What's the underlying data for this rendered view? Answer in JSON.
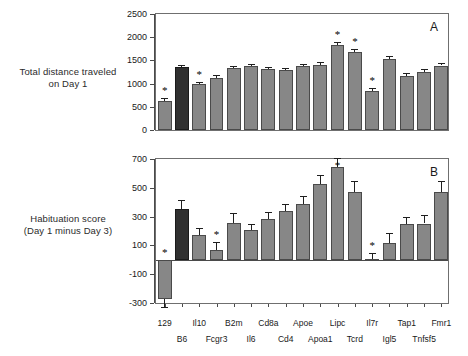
{
  "chart_data": [
    {
      "type": "bar",
      "panel": "A",
      "title": "",
      "ylabel": "Total distance traveled on Day 1",
      "ylabel_lines": [
        "Total distance traveled",
        "on Day 1"
      ],
      "xlabel": "",
      "ylim": [
        0,
        2500
      ],
      "yticks": [
        0,
        500,
        1000,
        1500,
        2000,
        2500
      ],
      "grid": false,
      "legend": "none",
      "categories": [
        "129",
        "B6",
        "Il10",
        "Fcgr3",
        "B2m",
        "Il6",
        "Cd8a",
        "Cd4",
        "Apoe",
        "Apoa1",
        "Lipc",
        "Tcrd",
        "Il7r",
        "Igl5",
        "Tap1",
        "Tnfsf5",
        "Fmr1"
      ],
      "values": [
        620,
        1355,
        995,
        1120,
        1330,
        1370,
        1310,
        1290,
        1370,
        1405,
        1835,
        1690,
        840,
        1525,
        1170,
        1260,
        1390
      ],
      "errors": [
        75,
        45,
        50,
        55,
        55,
        45,
        55,
        50,
        45,
        60,
        70,
        65,
        55,
        60,
        55,
        65,
        55
      ],
      "dark_bars": [
        "B6"
      ],
      "significant": [
        "129",
        "Il10",
        "Lipc",
        "Tcrd",
        "Il7r"
      ]
    },
    {
      "type": "bar",
      "panel": "B",
      "title": "",
      "ylabel": "Habituation score (Day 1 minus Day 3)",
      "ylabel_lines": [
        "Habituation score",
        "(Day 1 minus Day 3)"
      ],
      "xlabel": "",
      "ylim": [
        -300,
        700
      ],
      "yticks": [
        -300,
        -100,
        100,
        300,
        500,
        700
      ],
      "grid": false,
      "legend": "none",
      "categories": [
        "129",
        "B6",
        "Il10",
        "Fcgr3",
        "B2m",
        "Il6",
        "Cd8a",
        "Cd4",
        "Apoe",
        "Apoa1",
        "Lipc",
        "Tcrd",
        "Il7r",
        "Igl5",
        "Tap1",
        "Tnfsf5",
        "Fmr1"
      ],
      "values": [
        -272,
        352,
        175,
        70,
        255,
        205,
        280,
        337,
        390,
        525,
        645,
        472,
        8,
        118,
        250,
        252,
        472
      ],
      "errors": [
        55,
        60,
        48,
        55,
        70,
        45,
        55,
        50,
        55,
        62,
        62,
        78,
        42,
        70,
        48,
        60,
        72
      ],
      "dark_bars": [
        "B6"
      ],
      "significant": [
        "129",
        "Fcgr3",
        "Lipc",
        "Il7r"
      ]
    }
  ],
  "panels": {
    "a": {
      "letter": "A"
    },
    "b": {
      "letter": "B"
    }
  },
  "axis_labels": {
    "a_line1": "Total distance traveled",
    "a_line2": "on Day 1",
    "b_line1": "Habituation score",
    "b_line2": "(Day 1 minus Day 3)"
  },
  "yticks_a": [
    "2500",
    "2000",
    "1500",
    "1000",
    "500",
    "0"
  ],
  "yticks_b": [
    "700",
    "500",
    "300",
    "100",
    "-100",
    "-300"
  ],
  "xticks_row1": [
    "129",
    "Il10",
    "B2m",
    "Cd8a",
    "Apoe",
    "Lipc",
    "Il7r",
    "Tap1",
    "Fmr1"
  ],
  "xticks_row2": [
    "B6",
    "Fcgr3",
    "Il6",
    "Cd4",
    "Apoa1",
    "Tcrd",
    "Igl5",
    "Tnfsf5"
  ],
  "star_glyph": "*",
  "colors": {
    "bar_gray": "#878787",
    "bar_dark": "#303030",
    "axis": "#4a4a4a",
    "text": "#1a1a1a"
  }
}
